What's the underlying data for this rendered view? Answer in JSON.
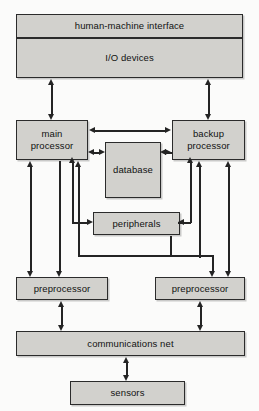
{
  "diagram": {
    "caption_fragment": "…  …  …  …  …  …",
    "style": {
      "box_fill": "#d2d1cd",
      "box_border": "#2b2b2b",
      "line_color": "#242424",
      "page_background": "#fbfbfa",
      "text_color": "#111111"
    },
    "nodes": [
      {
        "id": "hmi",
        "label": "human-machine interface"
      },
      {
        "id": "io",
        "label": "I/O devices"
      },
      {
        "id": "main_proc",
        "label_line1": "main",
        "label_line2": "processor"
      },
      {
        "id": "backup_proc",
        "label_line1": "backup",
        "label_line2": "processor"
      },
      {
        "id": "database",
        "label": "database"
      },
      {
        "id": "peripherals",
        "label": "peripherals"
      },
      {
        "id": "preproc_left",
        "label": "preprocessor"
      },
      {
        "id": "preproc_right",
        "label": "preprocessor"
      },
      {
        "id": "comms_net",
        "label": "communications net"
      },
      {
        "id": "sensors",
        "label": "sensors"
      }
    ],
    "edges": [
      {
        "from": "io",
        "to": "main_proc",
        "direction": "bidirectional",
        "routing": "vertical-left"
      },
      {
        "from": "io",
        "to": "backup_proc",
        "direction": "bidirectional",
        "routing": "vertical-right"
      },
      {
        "from": "main_proc",
        "to": "backup_proc",
        "direction": "bidirectional",
        "routing": "horizontal-top"
      },
      {
        "from": "main_proc",
        "to": "database",
        "direction": "bidirectional",
        "routing": "horizontal"
      },
      {
        "from": "database",
        "to": "backup_proc",
        "direction": "bidirectional",
        "routing": "horizontal"
      },
      {
        "from": "main_proc",
        "to": "peripherals",
        "direction": "bidirectional",
        "routing": "elbow-left"
      },
      {
        "from": "peripherals",
        "to": "backup_proc",
        "direction": "bidirectional",
        "routing": "elbow-right"
      },
      {
        "from": "main_proc",
        "to": "preproc_left",
        "direction": "bidirectional",
        "routing": "vertical-outer-left"
      },
      {
        "from": "main_proc",
        "to": "preproc_left",
        "direction": "down",
        "routing": "vertical-inner-left"
      },
      {
        "from": "preproc_right",
        "to": "main_proc",
        "direction": "up",
        "routing": "vertical-cross"
      },
      {
        "from": "backup_proc",
        "to": "preproc_right",
        "direction": "bidirectional",
        "routing": "vertical-outer-right"
      },
      {
        "from": "backup_proc",
        "to": "preproc_left",
        "direction": "down",
        "routing": "elbow-cross-left"
      },
      {
        "from": "peripherals",
        "to": "preproc_right",
        "direction": "down",
        "routing": "elbow-cross-right"
      },
      {
        "from": "preproc_left",
        "to": "comms_net",
        "direction": "bidirectional",
        "routing": "vertical"
      },
      {
        "from": "preproc_right",
        "to": "comms_net",
        "direction": "bidirectional",
        "routing": "vertical"
      },
      {
        "from": "comms_net",
        "to": "sensors",
        "direction": "bidirectional",
        "routing": "vertical"
      }
    ]
  }
}
